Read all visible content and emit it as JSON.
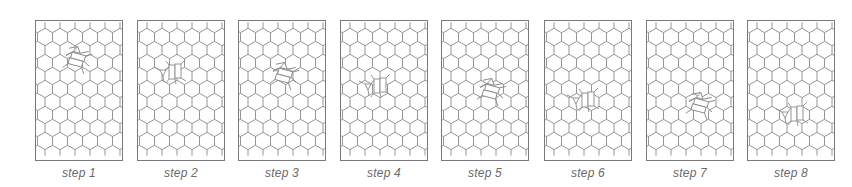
{
  "figure": {
    "colors": {
      "border": "#7a7a7a",
      "lattice": "#8a8a8a",
      "label": "#6a6a6a",
      "background": "#ffffff"
    },
    "lattice": {
      "type": "hexagonal",
      "orientation": "pointy-top",
      "hex_width": 15,
      "rows": 9,
      "cols": 6
    },
    "panels": [
      {
        "label": "step 1",
        "x": 35,
        "defect": {
          "cx": 42,
          "cy": 40,
          "orientation": "tilted"
        }
      },
      {
        "label": "step 2",
        "x": 137,
        "defect": {
          "cx": 32,
          "cy": 52,
          "orientation": "vertical"
        }
      },
      {
        "label": "step 3",
        "x": 238,
        "defect": {
          "cx": 46,
          "cy": 56,
          "orientation": "tilted"
        }
      },
      {
        "label": "step 4",
        "x": 340,
        "defect": {
          "cx": 34,
          "cy": 66,
          "orientation": "vertical"
        }
      },
      {
        "label": "step 5",
        "x": 441,
        "defect": {
          "cx": 50,
          "cy": 72,
          "orientation": "tilted"
        }
      },
      {
        "label": "step 6",
        "x": 544,
        "defect": {
          "cx": 38,
          "cy": 80,
          "orientation": "vertical"
        }
      },
      {
        "label": "step 7",
        "x": 646,
        "defect": {
          "cx": 54,
          "cy": 86,
          "orientation": "tilted"
        }
      },
      {
        "label": "step 8",
        "x": 747,
        "defect": {
          "cx": 44,
          "cy": 94,
          "orientation": "vertical"
        }
      }
    ]
  }
}
